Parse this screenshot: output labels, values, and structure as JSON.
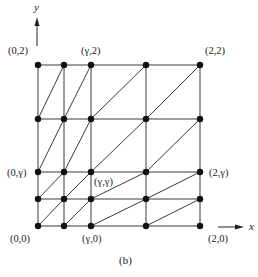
{
  "figure": {
    "caption": "(b)",
    "axes": {
      "x_label": "x",
      "y_label": "y"
    },
    "grid": {
      "x_coords": [
        38,
        64,
        91,
        146,
        200
      ],
      "y_coords": [
        65,
        119,
        172,
        199,
        226
      ],
      "diagonal_direction": "bottom-left to top-right in every cell"
    },
    "labels": {
      "top_left": "(0,2)",
      "top_gamma": "(γ,2)",
      "top_right": "(2,2)",
      "left_gamma": "(0,γ)",
      "center_gamma": "(γ,γ)",
      "right_gamma": "(2,γ)",
      "bottom_left": "(0,0)",
      "bottom_gamma": "(γ,0)",
      "bottom_right": "(2,0)"
    },
    "colors": {
      "line": "#3a3a3a",
      "node": "#111111"
    }
  }
}
